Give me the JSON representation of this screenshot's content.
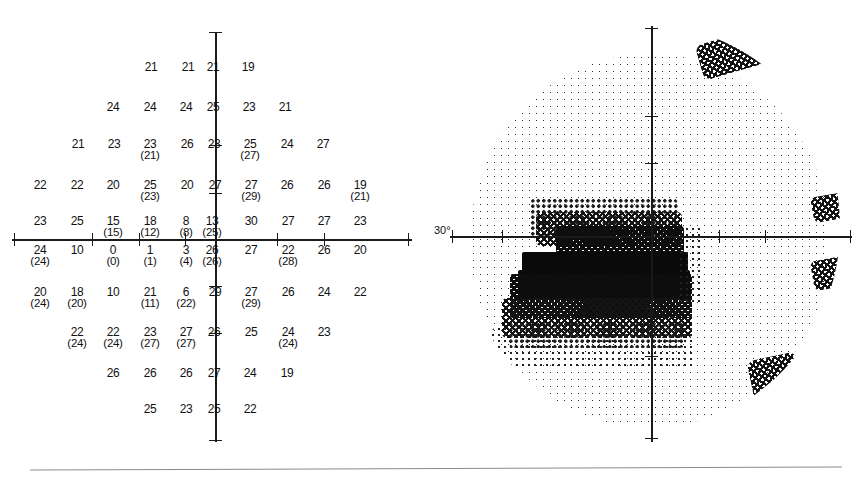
{
  "report": {
    "title": "Humphrey visual field printout",
    "numeric_plot": {
      "name": "numeric threshold plot",
      "axis_unit": "dB",
      "rows": [
        {
          "y": 62,
          "cells": [
            {
              "x": 151,
              "main": "21",
              "paren": ""
            },
            {
              "x": 188,
              "main": "21",
              "paren": ""
            },
            {
              "x": 213,
              "main": "21",
              "paren": ""
            },
            {
              "x": 248,
              "main": "19",
              "paren": ""
            }
          ]
        },
        {
          "y": 102,
          "cells": [
            {
              "x": 113,
              "main": "24",
              "paren": ""
            },
            {
              "x": 150,
              "main": "24",
              "paren": ""
            },
            {
              "x": 186,
              "main": "24",
              "paren": ""
            },
            {
              "x": 213,
              "main": "25",
              "paren": ""
            },
            {
              "x": 249,
              "main": "23",
              "paren": ""
            },
            {
              "x": 285,
              "main": "21",
              "paren": ""
            }
          ]
        },
        {
          "y": 139,
          "cells": [
            {
              "x": 78,
              "main": "21",
              "paren": ""
            },
            {
              "x": 114,
              "main": "23",
              "paren": ""
            },
            {
              "x": 150,
              "main": "23",
              "paren": "(21)"
            },
            {
              "x": 187,
              "main": "26",
              "paren": ""
            },
            {
              "x": 214,
              "main": "23",
              "paren": ""
            },
            {
              "x": 250,
              "main": "25",
              "paren": "(27)"
            },
            {
              "x": 287,
              "main": "24",
              "paren": ""
            },
            {
              "x": 323,
              "main": "27",
              "paren": ""
            }
          ]
        },
        {
          "y": 180,
          "cells": [
            {
              "x": 40,
              "main": "22",
              "paren": ""
            },
            {
              "x": 77,
              "main": "22",
              "paren": ""
            },
            {
              "x": 113,
              "main": "20",
              "paren": ""
            },
            {
              "x": 150,
              "main": "25",
              "paren": "(23)"
            },
            {
              "x": 187,
              "main": "20",
              "paren": ""
            },
            {
              "x": 215,
              "main": "27",
              "paren": ""
            },
            {
              "x": 251,
              "main": "27",
              "paren": "(29)"
            },
            {
              "x": 287,
              "main": "26",
              "paren": ""
            },
            {
              "x": 324,
              "main": "26",
              "paren": ""
            },
            {
              "x": 360,
              "main": "19",
              "paren": "(21)"
            }
          ]
        },
        {
          "y": 216,
          "cells": [
            {
              "x": 40,
              "main": "23",
              "paren": ""
            },
            {
              "x": 77,
              "main": "25",
              "paren": ""
            },
            {
              "x": 113,
              "main": "15",
              "paren": "(15)"
            },
            {
              "x": 150,
              "main": "18",
              "paren": "(12)"
            },
            {
              "x": 186,
              "main": "8",
              "paren": "(8)"
            },
            {
              "x": 212,
              "main": "13",
              "paren": "(25)"
            },
            {
              "x": 251,
              "main": "30",
              "paren": ""
            },
            {
              "x": 288,
              "main": "27",
              "paren": ""
            },
            {
              "x": 324,
              "main": "27",
              "paren": ""
            },
            {
              "x": 360,
              "main": "23",
              "paren": ""
            }
          ]
        },
        {
          "y": 245,
          "cells": [
            {
              "x": 40,
              "main": "24",
              "paren": "(24)"
            },
            {
              "x": 77,
              "main": "10",
              "paren": ""
            },
            {
              "x": 113,
              "main": "0",
              "paren": "(0)"
            },
            {
              "x": 150,
              "main": "1",
              "paren": "(1)"
            },
            {
              "x": 186,
              "main": "3",
              "paren": "(4)"
            },
            {
              "x": 212,
              "main": "26",
              "paren": "(26)"
            },
            {
              "x": 251,
              "main": "27",
              "paren": ""
            },
            {
              "x": 288,
              "main": "22",
              "paren": "(28)"
            },
            {
              "x": 324,
              "main": "26",
              "paren": ""
            },
            {
              "x": 360,
              "main": "20",
              "paren": ""
            }
          ]
        },
        {
          "y": 287,
          "cells": [
            {
              "x": 40,
              "main": "20",
              "paren": "(24)"
            },
            {
              "x": 77,
              "main": "18",
              "paren": "(20)"
            },
            {
              "x": 113,
              "main": "10",
              "paren": ""
            },
            {
              "x": 150,
              "main": "21",
              "paren": "(11)"
            },
            {
              "x": 186,
              "main": "6",
              "paren": "(22)"
            },
            {
              "x": 215,
              "main": "29",
              "paren": ""
            },
            {
              "x": 251,
              "main": "27",
              "paren": "(29)"
            },
            {
              "x": 288,
              "main": "26",
              "paren": ""
            },
            {
              "x": 324,
              "main": "24",
              "paren": ""
            },
            {
              "x": 360,
              "main": "22",
              "paren": ""
            }
          ]
        },
        {
          "y": 327,
          "cells": [
            {
              "x": 77,
              "main": "22",
              "paren": "(24)"
            },
            {
              "x": 113,
              "main": "22",
              "paren": "(24)"
            },
            {
              "x": 150,
              "main": "23",
              "paren": "(27)"
            },
            {
              "x": 186,
              "main": "27",
              "paren": "(27)"
            },
            {
              "x": 214,
              "main": "26",
              "paren": ""
            },
            {
              "x": 251,
              "main": "25",
              "paren": ""
            },
            {
              "x": 288,
              "main": "24",
              "paren": "(24)"
            },
            {
              "x": 324,
              "main": "23",
              "paren": ""
            }
          ]
        },
        {
          "y": 368,
          "cells": [
            {
              "x": 113,
              "main": "26",
              "paren": ""
            },
            {
              "x": 150,
              "main": "26",
              "paren": ""
            },
            {
              "x": 186,
              "main": "26",
              "paren": ""
            },
            {
              "x": 214,
              "main": "27",
              "paren": ""
            },
            {
              "x": 250,
              "main": "24",
              "paren": ""
            },
            {
              "x": 287,
              "main": "19",
              "paren": ""
            }
          ]
        },
        {
          "y": 404,
          "cells": [
            {
              "x": 150,
              "main": "25",
              "paren": ""
            },
            {
              "x": 186,
              "main": "23",
              "paren": ""
            },
            {
              "x": 214,
              "main": "25",
              "paren": ""
            },
            {
              "x": 250,
              "main": "22",
              "paren": ""
            }
          ]
        }
      ],
      "axis_ticks_horizontal": [
        14,
        92,
        139,
        185,
        277,
        324,
        408
      ],
      "axis_ticks_vertical": [
        32,
        145,
        193,
        286,
        333,
        440
      ]
    },
    "grayscale_map": {
      "name": "grayscale deviation map",
      "degree_label": "30°",
      "axis_ticks_horizontal": [
        20,
        70,
        116,
        287,
        333,
        418
      ],
      "axis_ticks_vertical": [
        20,
        108,
        155,
        300,
        348,
        430
      ],
      "patches": [
        {
          "level": "lvl1",
          "x": 10,
          "y": 28,
          "w": 360,
          "h": 374,
          "radius": "50%"
        },
        {
          "level": "lvl4",
          "x": 238,
          "y": 8,
          "w": 82,
          "h": 36,
          "radius": "8px",
          "rot": -16
        },
        {
          "level": "lvl4",
          "x": 352,
          "y": 168,
          "w": 40,
          "h": 26,
          "radius": "6px",
          "rot": -10
        },
        {
          "level": "lvl4",
          "x": 352,
          "y": 232,
          "w": 40,
          "h": 30,
          "radius": "6px",
          "rot": -10
        },
        {
          "level": "lvl4",
          "x": 290,
          "y": 330,
          "w": 50,
          "h": 40,
          "radius": "8px",
          "rot": -12
        },
        {
          "level": "lvl3",
          "x": 70,
          "y": 172,
          "w": 148,
          "h": 40,
          "radius": "6px"
        },
        {
          "level": "lvl4",
          "x": 76,
          "y": 186,
          "w": 146,
          "h": 34,
          "radius": "5px"
        },
        {
          "level": "lvl5",
          "x": 96,
          "y": 200,
          "w": 128,
          "h": 28,
          "radius": "4px"
        },
        {
          "level": "lvl6",
          "x": 62,
          "y": 226,
          "w": 166,
          "h": 22,
          "radius": "2px"
        },
        {
          "level": "lvl6",
          "x": 58,
          "y": 244,
          "w": 172,
          "h": 30,
          "radius": "2px"
        },
        {
          "level": "lvl5",
          "x": 50,
          "y": 248,
          "w": 182,
          "h": 44,
          "radius": "3px"
        },
        {
          "level": "lvl4",
          "x": 42,
          "y": 272,
          "w": 190,
          "h": 40,
          "radius": "5px"
        },
        {
          "level": "lvl3",
          "x": 48,
          "y": 296,
          "w": 178,
          "h": 26,
          "radius": "6px"
        },
        {
          "level": "lvl2",
          "x": 30,
          "y": 300,
          "w": 206,
          "h": 42,
          "radius": "10px"
        },
        {
          "level": "lvl2",
          "x": 218,
          "y": 200,
          "w": 26,
          "h": 76,
          "radius": "4px"
        }
      ]
    }
  }
}
